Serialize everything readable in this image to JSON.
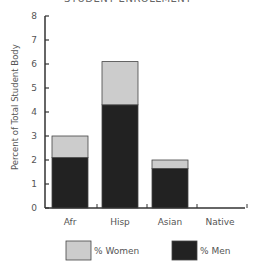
{
  "chart_data": {
    "type": "bar",
    "stacked": true,
    "title": "STUDENT ENROLLMENT",
    "xlabel": "",
    "ylabel": "Percent of Total Student Body",
    "ylim": [
      0,
      8
    ],
    "yticks": [
      0,
      1,
      2,
      3,
      4,
      5,
      6,
      7,
      8
    ],
    "categories": [
      "Afr",
      "Hisp",
      "Asian",
      "Native"
    ],
    "series": [
      {
        "name": "% Men",
        "color": "#222222",
        "values": [
          2.1,
          4.3,
          1.65,
          0
        ]
      },
      {
        "name": "% Women",
        "color": "#cccccc",
        "values": [
          0.9,
          1.8,
          0.35,
          0
        ]
      }
    ],
    "totals": [
      3.0,
      6.1,
      2.0,
      0
    ],
    "grid": false,
    "legend_position": "bottom"
  },
  "legend": {
    "women_label": "% Women",
    "men_label": "% Men"
  }
}
